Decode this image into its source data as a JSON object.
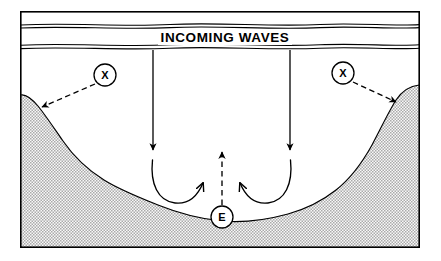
{
  "figure": {
    "title": "INCOMING WAVES",
    "frame": {
      "name": "figure-border",
      "stroke_color": "#000000",
      "fill_color": "#ffffff",
      "x": 20,
      "y": 11,
      "width": 400,
      "height": 237
    }
  },
  "colors": {
    "ink": "#000000",
    "water_fill": "#ffffff",
    "seabed_fill": "#c9c9c9",
    "seabed_stipple": "#8f8f8f",
    "page_background": "#ffffff"
  },
  "water_surface": {
    "name": "incoming-waves-band",
    "label": "INCOMING WAVES",
    "label_x": 225,
    "label_y": 42,
    "upper_line_y": 25,
    "lower_line_y": 46,
    "line_count": 2
  },
  "seabed": {
    "name": "seabed-profile",
    "label": "seabed",
    "fill": "#c9c9c9"
  },
  "wave_energy_arrows": [
    {
      "name": "wave-energy-arrow-left",
      "label": "incoming wave energy (left)",
      "x": 153,
      "y_start": 50,
      "y_end": 150,
      "direction": "down"
    },
    {
      "name": "wave-energy-arrow-right",
      "label": "incoming wave energy (right)",
      "x": 290,
      "y_start": 50,
      "y_end": 150,
      "direction": "down"
    }
  ],
  "return_currents": [
    {
      "name": "return-current-left",
      "label": "bottom return current (left)",
      "direction": "clockwise-up-right"
    },
    {
      "name": "return-current-right",
      "label": "bottom return current (right)",
      "direction": "counterclockwise-up-left"
    }
  ],
  "escape_flow": {
    "name": "escape-flow-arrow",
    "label": "escape / rip current (dashed, upward)",
    "x": 222,
    "y_start": 205,
    "y_end": 152,
    "style": "dashed",
    "direction": "up"
  },
  "markers": [
    {
      "name": "marker-x-left",
      "letter": "X",
      "label": "erosion point left",
      "cx": 105,
      "cy": 75,
      "r": 11,
      "arrow": {
        "name": "marker-x-left-arrow",
        "label": "dashed pointer to left flank",
        "style": "dashed",
        "from_x": 95,
        "from_y": 84,
        "to_x": 42,
        "to_y": 107
      }
    },
    {
      "name": "marker-x-right",
      "letter": "X",
      "label": "erosion point right",
      "cx": 343,
      "cy": 73,
      "r": 11,
      "arrow": {
        "name": "marker-x-right-arrow",
        "label": "dashed pointer to right flank",
        "style": "dashed",
        "from_x": 353,
        "from_y": 82,
        "to_x": 396,
        "to_y": 102
      }
    },
    {
      "name": "marker-e-center",
      "letter": "E",
      "label": "escape point (center)",
      "cx": 222,
      "cy": 217,
      "r": 11
    }
  ]
}
